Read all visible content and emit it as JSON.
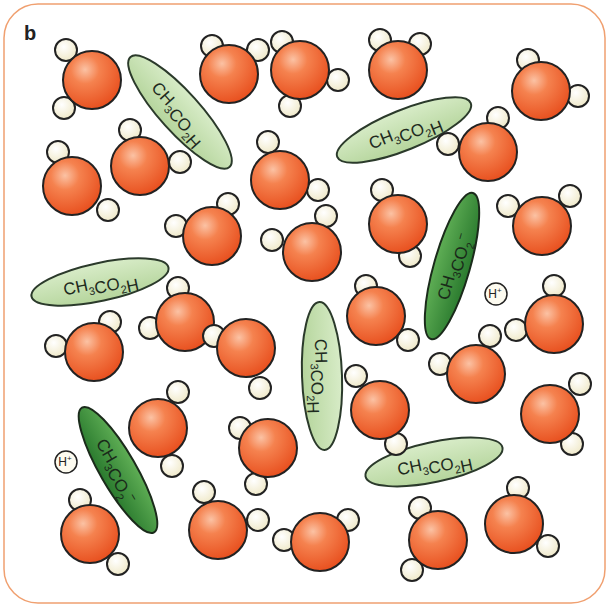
{
  "panel": {
    "label": "b",
    "border_color": "#f0a070",
    "background": "#ffffff"
  },
  "colors": {
    "oxygen_fill": "#f26b3a",
    "oxygen_highlight": "#f9b08f",
    "hydrogen_fill": "#f8f4dc",
    "acid_fill": "#c7e0b4",
    "ion_fill": "#3e8f3e",
    "stroke": "#222222"
  },
  "legend_labels": {
    "acetic_acid": "CH3CO2H",
    "acetate_ion": "CH3CO2-",
    "proton": "H+"
  },
  "water_molecules": [
    {
      "x": 92,
      "y": 80,
      "h": [
        [
          66,
          50
        ],
        [
          64,
          108
        ]
      ]
    },
    {
      "x": 229,
      "y": 74,
      "h": [
        [
          212,
          46
        ],
        [
          258,
          50
        ]
      ]
    },
    {
      "x": 300,
      "y": 70,
      "h": [
        [
          282,
          42
        ],
        [
          338,
          80
        ],
        [
          290,
          106
        ]
      ]
    },
    {
      "x": 398,
      "y": 70,
      "h": [
        [
          380,
          40
        ],
        [
          420,
          44
        ]
      ]
    },
    {
      "x": 541,
      "y": 91,
      "h": [
        [
          528,
          60
        ],
        [
          578,
          96
        ]
      ]
    },
    {
      "x": 72,
      "y": 186,
      "h": [
        [
          58,
          152
        ],
        [
          108,
          210
        ]
      ]
    },
    {
      "x": 140,
      "y": 166,
      "h": [
        [
          130,
          130
        ],
        [
          180,
          162
        ]
      ]
    },
    {
      "x": 280,
      "y": 180,
      "h": [
        [
          268,
          142
        ],
        [
          318,
          190
        ]
      ]
    },
    {
      "x": 488,
      "y": 152,
      "h": [
        [
          448,
          144
        ],
        [
          498,
          118
        ]
      ]
    },
    {
      "x": 212,
      "y": 236,
      "h": [
        [
          176,
          226
        ],
        [
          228,
          204
        ]
      ]
    },
    {
      "x": 312,
      "y": 252,
      "h": [
        [
          272,
          240
        ],
        [
          326,
          216
        ]
      ]
    },
    {
      "x": 398,
      "y": 224,
      "h": [
        [
          382,
          190
        ],
        [
          410,
          256
        ]
      ]
    },
    {
      "x": 542,
      "y": 226,
      "h": [
        [
          508,
          206
        ],
        [
          570,
          196
        ]
      ]
    },
    {
      "x": 185,
      "y": 322,
      "h": [
        [
          150,
          328
        ],
        [
          178,
          288
        ]
      ]
    },
    {
      "x": 94,
      "y": 352,
      "h": [
        [
          56,
          346
        ],
        [
          110,
          322
        ]
      ]
    },
    {
      "x": 246,
      "y": 348,
      "h": [
        [
          260,
          388
        ],
        [
          214,
          336
        ]
      ]
    },
    {
      "x": 376,
      "y": 316,
      "h": [
        [
          408,
          340
        ],
        [
          366,
          286
        ]
      ]
    },
    {
      "x": 554,
      "y": 324,
      "h": [
        [
          516,
          330
        ],
        [
          554,
          286
        ]
      ]
    },
    {
      "x": 476,
      "y": 374,
      "h": [
        [
          440,
          364
        ],
        [
          490,
          336
        ]
      ]
    },
    {
      "x": 380,
      "y": 410,
      "h": [
        [
          356,
          376
        ],
        [
          396,
          444
        ]
      ]
    },
    {
      "x": 158,
      "y": 428,
      "h": [
        [
          172,
          466
        ],
        [
          178,
          392
        ]
      ]
    },
    {
      "x": 268,
      "y": 448,
      "h": [
        [
          240,
          428
        ],
        [
          256,
          484
        ]
      ]
    },
    {
      "x": 550,
      "y": 414,
      "h": [
        [
          580,
          384
        ],
        [
          572,
          444
        ]
      ]
    },
    {
      "x": 218,
      "y": 530,
      "h": [
        [
          204,
          492
        ],
        [
          258,
          520
        ]
      ]
    },
    {
      "x": 320,
      "y": 542,
      "h": [
        [
          284,
          540
        ],
        [
          348,
          520
        ]
      ]
    },
    {
      "x": 438,
      "y": 540,
      "h": [
        [
          420,
          508
        ],
        [
          412,
          570
        ]
      ]
    },
    {
      "x": 514,
      "y": 524,
      "h": [
        [
          518,
          488
        ],
        [
          548,
          546
        ]
      ]
    },
    {
      "x": 90,
      "y": 534,
      "h": [
        [
          80,
          500
        ],
        [
          118,
          564
        ]
      ]
    }
  ],
  "acid_molecules": [
    {
      "x": 180,
      "y": 112,
      "rx": 74,
      "ry": 20,
      "rot": 48,
      "label": "CH3CO2H"
    },
    {
      "x": 404,
      "y": 130,
      "rx": 72,
      "ry": 20,
      "rot": -22,
      "label": "CH3CO2H"
    },
    {
      "x": 100,
      "y": 282,
      "rx": 70,
      "ry": 19,
      "rot": -12,
      "label": "CH3CO2H"
    },
    {
      "x": 322,
      "y": 376,
      "rx": 74,
      "ry": 20,
      "rot": 88,
      "label": "CH3CO2H"
    },
    {
      "x": 434,
      "y": 462,
      "rx": 70,
      "ry": 20,
      "rot": -12,
      "label": "CH3CO2H"
    }
  ],
  "ion_molecules": [
    {
      "x": 452,
      "y": 266,
      "rx": 76,
      "ry": 18,
      "rot": -74,
      "label": "CH3CO2-"
    },
    {
      "x": 118,
      "y": 470,
      "rx": 72,
      "ry": 18,
      "rot": 60,
      "label": "CH3CO2-"
    }
  ],
  "protons": [
    {
      "x": 496,
      "y": 294,
      "label": "H+"
    },
    {
      "x": 66,
      "y": 462,
      "label": "H+"
    }
  ]
}
